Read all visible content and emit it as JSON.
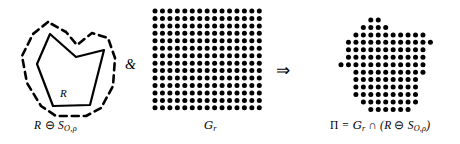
{
  "figure": {
    "panels": [
      {
        "id": "left",
        "name": "eroded-region",
        "label": "R ⊖ S",
        "label_sub": "O,ρ",
        "inner_label": "R",
        "description": "Solid polygon R with dashed erosion boundary around it"
      },
      {
        "id": "middle",
        "name": "sampling-grid",
        "label": "𝑢",
        "label_sub": "r",
        "label_plain": "G",
        "description": "Regular square grid of filled dots"
      },
      {
        "id": "right",
        "name": "intersection-result",
        "label": "Π = G",
        "label_sub": "r",
        "label_rest": " ∩ (R ⊖ S",
        "label_sub2": "O,ρ",
        "label_end": ")",
        "description": "Dot pattern clipped to the eroded polygon shape"
      }
    ],
    "operators": [
      {
        "name": "ampersand-operator",
        "symbol": "&"
      },
      {
        "name": "implies-operator",
        "symbol": "⇒"
      }
    ],
    "colors": {
      "ink": "#000000",
      "paper": "#ffffff"
    },
    "polygon": {
      "points": "50,34 37,64 53,106 90,105 104,50 76,57",
      "stroke_width": 2.2
    },
    "erosion_outline": {
      "points": "48,22 33,34 22,56 27,83 41,106 56,116 86,116 101,108 113,86 115,58 108,38 92,33 77,45 66,32",
      "stroke_width": 2.6,
      "dash": "7,5"
    },
    "grid": {
      "cols": 15,
      "rows": 14,
      "spacing": 7.45,
      "dot_radius": 2.5,
      "origin_x": 155,
      "origin_y": 11
    },
    "result_grid": {
      "origin_x": 341,
      "origin_y": 20,
      "rows": [
        [
          4,
          5
        ],
        [
          3,
          4,
          5,
          6
        ],
        [
          2,
          3,
          4,
          5,
          6,
          7,
          8,
          9,
          10,
          11
        ],
        [
          1,
          2,
          3,
          4,
          5,
          6,
          7,
          8,
          9,
          10,
          11,
          12
        ],
        [
          1,
          2,
          3,
          4,
          5,
          6,
          7,
          8,
          9,
          10,
          11
        ],
        [
          1,
          2,
          3,
          4,
          5,
          6,
          7,
          8,
          9,
          10,
          11
        ],
        [
          0,
          1,
          2,
          3,
          4,
          5,
          6,
          7,
          8,
          9,
          10,
          11
        ],
        [
          2,
          3,
          4,
          5,
          6,
          7,
          8,
          9,
          10,
          11
        ],
        [
          2,
          3,
          4,
          5,
          6,
          7,
          8,
          9,
          10
        ],
        [
          2,
          3,
          4,
          5,
          6,
          7,
          8,
          9,
          10
        ],
        [
          2,
          3,
          4,
          5,
          6,
          7,
          8,
          9,
          10
        ],
        [
          3,
          4,
          5,
          6,
          7,
          8,
          9,
          10
        ],
        [
          4,
          5,
          6,
          7,
          8,
          9
        ]
      ]
    }
  }
}
